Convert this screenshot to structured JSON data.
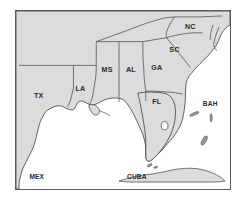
{
  "figure": {
    "kind": "map",
    "region_title": "Southeastern United States, Gulf of Mexico and Caribbean",
    "projection_note": "outline map with state boundaries"
  },
  "colors": {
    "land": "#dcdcdc",
    "water": "#ffffff",
    "border_line": "#4a4a4a",
    "coastline": "#3c3c3c",
    "frame": "#5a5a5a",
    "label_text": "#2b2b2b",
    "page_background": "#ffffff"
  },
  "labels": {
    "tx": "TX",
    "la": "LA",
    "ms": "MS",
    "al": "AL",
    "ga": "GA",
    "fl": "FL",
    "sc": "SC",
    "nc": "NC",
    "mex": "MEX",
    "cuba": "CUBA",
    "bah": "BAH"
  },
  "features": {
    "states": [
      {
        "code": "TX",
        "name_label": "TX"
      },
      {
        "code": "LA",
        "name_label": "LA"
      },
      {
        "code": "MS",
        "name_label": "MS"
      },
      {
        "code": "AL",
        "name_label": "AL"
      },
      {
        "code": "GA",
        "name_label": "GA"
      },
      {
        "code": "FL",
        "name_label": "FL"
      },
      {
        "code": "SC",
        "name_label": "SC"
      },
      {
        "code": "NC",
        "name_label": "NC"
      }
    ],
    "countries": [
      {
        "code": "MEX",
        "name_label": "MEX"
      },
      {
        "code": "CUBA",
        "name_label": "CUBA"
      },
      {
        "code": "BAH",
        "name_label": "BAH"
      }
    ],
    "waterbodies": [
      {
        "name": "Gulf of Mexico",
        "labeled": false
      },
      {
        "name": "Atlantic Ocean",
        "labeled": false
      }
    ],
    "lakes": [
      {
        "name": "Lake Okeechobee",
        "labeled": false
      }
    ],
    "islands": [
      {
        "name": "Bahamas island chain",
        "count": 3
      },
      {
        "name": "Cuba",
        "count": 1
      },
      {
        "name": "Florida Keys",
        "count": 2
      }
    ]
  }
}
